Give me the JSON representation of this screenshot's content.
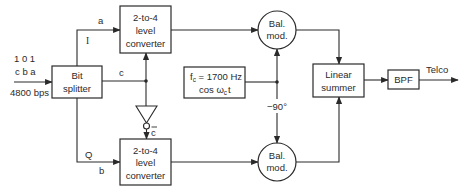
{
  "input": {
    "bits": "1 0 1",
    "bit_names": "c b a",
    "rate": "4800 bps"
  },
  "blocks": {
    "bit_splitter": {
      "line1": "Bit",
      "line2": "splitter"
    },
    "converter_top": {
      "line1": "2-to-4",
      "line2": "level",
      "line3": "converter"
    },
    "converter_bottom": {
      "line1": "2-to-4",
      "line2": "level",
      "line3": "converter"
    },
    "balmod_top": {
      "line1": "Bal.",
      "line2": "mod."
    },
    "balmod_bottom": {
      "line1": "Bal.",
      "line2": "mod."
    },
    "oscillator": {
      "line1_f": "f",
      "line1_sub": "c",
      "line1_rest": " = 1700 Hz",
      "line2_cos": "cos ω",
      "line2_sub": "c",
      "line2_t": "t"
    },
    "linear_summer": {
      "line1": "Linear",
      "line2": "summer"
    },
    "bpf": {
      "label": "BPF"
    }
  },
  "signals": {
    "i_channel": "I",
    "i_bit": "a",
    "q_channel": "Q",
    "q_bit": "b",
    "c_bit": "c",
    "c_bar": "c",
    "phase_shift": "−90°",
    "output": "Telco"
  },
  "colors": {
    "ink": "#2a2a2a",
    "background": "#ffffff"
  }
}
